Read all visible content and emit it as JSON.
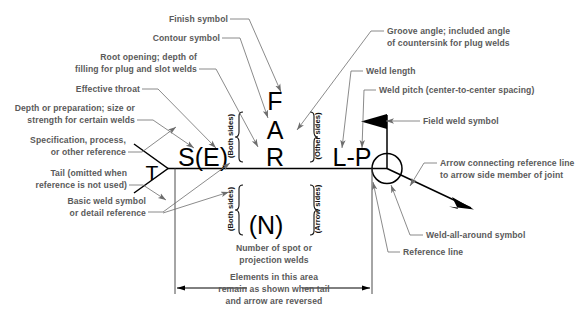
{
  "diagram": {
    "colors": {
      "label_text": "#5a5a5a",
      "symbol_text": "#000000",
      "leader_line": "#6d6d6d",
      "reference_line": "#000000",
      "background": "#ffffff"
    },
    "symbols": {
      "finish": "F",
      "contour": "A",
      "root_opening": "R",
      "effective_throat": "S(E)",
      "tail": "T",
      "length_pitch": "L-P",
      "number_of_welds": "(N)"
    },
    "brace_labels": {
      "both_sides_upper": "(Both sides)",
      "both_sides_lower": "(Both sides)",
      "other_sides": "(Other sides)",
      "arrow_sides": "(Arrow sides)"
    },
    "callouts": [
      {
        "id": "finish-symbol",
        "lines": [
          "Finish symbol"
        ]
      },
      {
        "id": "contour-symbol",
        "lines": [
          "Contour symbol"
        ]
      },
      {
        "id": "root-opening",
        "lines": [
          "Root opening; depth of",
          "filling for plug and slot welds"
        ]
      },
      {
        "id": "effective-throat",
        "lines": [
          "Effective throat"
        ]
      },
      {
        "id": "depth-preparation",
        "lines": [
          "Depth or preparation; size or",
          "strength for certain welds"
        ]
      },
      {
        "id": "specification-process",
        "lines": [
          "Specification, process,",
          "or other reference"
        ]
      },
      {
        "id": "tail",
        "lines": [
          "Tail (omitted when",
          "reference is not used)"
        ]
      },
      {
        "id": "basic-weld-symbol",
        "lines": [
          "Basic weld symbol",
          "or detail reference"
        ]
      },
      {
        "id": "groove-angle",
        "lines": [
          "Groove angle; included angle",
          "of countersink for plug welds"
        ]
      },
      {
        "id": "weld-length",
        "lines": [
          "Weld length"
        ]
      },
      {
        "id": "weld-pitch",
        "lines": [
          "Weld pitch (center-to-center spacing)"
        ]
      },
      {
        "id": "field-weld-symbol",
        "lines": [
          "Field weld symbol"
        ]
      },
      {
        "id": "arrow-connecting",
        "lines": [
          "Arrow connecting reference line",
          "to arrow side member of joint"
        ]
      },
      {
        "id": "weld-all-around",
        "lines": [
          "Weld-all-around symbol"
        ]
      },
      {
        "id": "reference-line",
        "lines": [
          "Reference line"
        ]
      },
      {
        "id": "number-of-spot",
        "lines": [
          "Number of spot or",
          "projection welds"
        ]
      },
      {
        "id": "elements-note",
        "lines": [
          "Elements in this area",
          "remain as shown when tail",
          "and arrow are reversed"
        ]
      }
    ],
    "text": {
      "finish_symbol": "Finish symbol",
      "contour_symbol": "Contour symbol",
      "root_opening_l1": "Root opening; depth of",
      "root_opening_l2": "filling for plug and slot welds",
      "effective_throat": "Effective throat",
      "depth_prep_l1": "Depth or preparation; size or",
      "depth_prep_l2": "strength for certain welds",
      "spec_process_l1": "Specification, process,",
      "spec_process_l2": "or other reference",
      "tail_l1": "Tail (omitted when",
      "tail_l2": "reference is not used)",
      "basic_weld_l1": "Basic weld symbol",
      "basic_weld_l2": "or detail reference",
      "groove_angle_l1": "Groove angle; included angle",
      "groove_angle_l2": "of countersink for plug welds",
      "weld_length": "Weld length",
      "weld_pitch": "Weld pitch (center-to-center spacing)",
      "field_weld": "Field weld symbol",
      "arrow_connecting_l1": "Arrow connecting reference line",
      "arrow_connecting_l2": "to arrow side member of joint",
      "weld_all_around": "Weld-all-around symbol",
      "reference_line": "Reference line",
      "number_spot_l1": "Number of spot or",
      "number_spot_l2": "projection welds",
      "elements_l1": "Elements in this area",
      "elements_l2": "remain as shown when tail",
      "elements_l3": "and arrow are reversed"
    }
  }
}
